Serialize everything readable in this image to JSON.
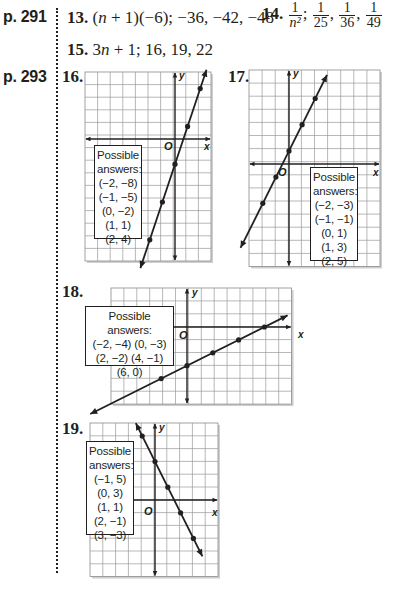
{
  "sections": [
    {
      "page_label": "p. 291"
    },
    {
      "page_label": "p. 293"
    }
  ],
  "answers": {
    "a13": {
      "num": "13.",
      "expr_parts": [
        "(",
        "n",
        " + 1)(−6); −36, −42, −48"
      ]
    },
    "a14": {
      "num": "14.",
      "fractions": [
        {
          "n": "1",
          "d": "n²"
        },
        {
          "n": "1",
          "d": "25"
        },
        {
          "n": "1",
          "d": "36"
        },
        {
          "n": "1",
          "d": "49"
        }
      ],
      "sep1": ";",
      "sep2": ",",
      "sep3": ","
    },
    "a15": {
      "num": "15.",
      "expr_parts": [
        "3",
        "n",
        " + 1; 16, 19, 22"
      ]
    }
  },
  "graphs": [
    {
      "num": "16.",
      "x_label": "x",
      "y_label": "y",
      "origin_label": "O",
      "box_lines": [
        "Possible",
        "answers:",
        "(−2, −8)",
        "(−1, −5)",
        "(0, −2)",
        "(1, 1)",
        "(2, 4)"
      ]
    },
    {
      "num": "17.",
      "x_label": "x",
      "y_label": "y",
      "origin_label": "O",
      "box_lines": [
        "Possible",
        "answers:",
        "(−2, −3)",
        "(−1, −1)",
        "(0, 1)",
        "(1, 3)",
        "(2, 5)"
      ]
    },
    {
      "num": "18.",
      "x_label": "x",
      "y_label": "y",
      "origin_label": "O",
      "box_lines": [
        "Possible answers:",
        "(−2, −4) (0, −3)",
        "(2, −2) (4, −1)",
        "(6, 0)"
      ]
    },
    {
      "num": "19.",
      "x_label": "x",
      "y_label": "y",
      "origin_label": "O",
      "box_lines": [
        "Possible",
        "answers:",
        "(−1, 5)",
        "(0, 3)",
        "(1, 1)",
        "(2, −1)",
        "(3, −3)"
      ]
    }
  ],
  "chart_data": [
    {
      "type": "line",
      "title": "16.",
      "equation": "y = 3x − 2",
      "points": [
        [
          -2,
          -8
        ],
        [
          -1,
          -5
        ],
        [
          0,
          -2
        ],
        [
          1,
          1
        ],
        [
          2,
          4
        ]
      ],
      "xlabel": "x",
      "ylabel": "y",
      "grid": true,
      "xlim": [
        -7,
        3
      ],
      "ylim": [
        -10,
        5
      ]
    },
    {
      "type": "line",
      "title": "17.",
      "equation": "y = 2x + 1",
      "points": [
        [
          -2,
          -3
        ],
        [
          -1,
          -1
        ],
        [
          0,
          1
        ],
        [
          1,
          3
        ],
        [
          2,
          5
        ]
      ],
      "xlabel": "x",
      "ylabel": "y",
      "grid": true,
      "xlim": [
        -3,
        7
      ],
      "ylim": [
        -8,
        7
      ]
    },
    {
      "type": "line",
      "title": "18.",
      "equation": "y = x/2 − 3",
      "points": [
        [
          -2,
          -4
        ],
        [
          0,
          -3
        ],
        [
          2,
          -2
        ],
        [
          4,
          -1
        ],
        [
          6,
          0
        ]
      ],
      "xlabel": "x",
      "ylabel": "y",
      "grid": true,
      "xlim": [
        -6,
        8
      ],
      "ylim": [
        -6,
        3
      ]
    },
    {
      "type": "line",
      "title": "19.",
      "equation": "y = −2x + 3",
      "points": [
        [
          -1,
          5
        ],
        [
          0,
          3
        ],
        [
          1,
          1
        ],
        [
          2,
          -1
        ],
        [
          3,
          -3
        ]
      ],
      "xlabel": "x",
      "ylabel": "y",
      "grid": true,
      "xlim": [
        -5,
        5
      ],
      "ylim": [
        -5,
        7
      ]
    }
  ]
}
